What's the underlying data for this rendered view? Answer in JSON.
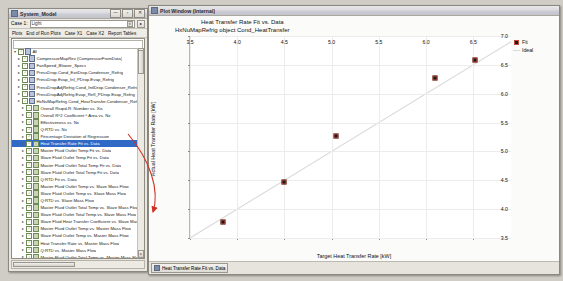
{
  "system_window": {
    "title": "System_Model",
    "icon": "app-icon",
    "buttons": {
      "minimize": "—",
      "maximize": "▫",
      "close": "✕"
    },
    "toolbar": {
      "case_label": "Case 1:",
      "case_value": "Light",
      "dropdown_icon": "▾",
      "button_icon": "▸"
    },
    "menu": [
      "Plots",
      "End of Run Plots",
      "Case X1",
      "Case X2",
      "Report Tables"
    ],
    "search_placeholder": "",
    "tree": [
      {
        "label": "All",
        "depth": 0,
        "checked": true,
        "expanded": true,
        "icon": "folder-icon"
      },
      {
        "label": "CompressorMapRev (CompressorFromData)",
        "depth": 1,
        "checked": true,
        "icon": "file-icon"
      },
      {
        "label": "FanSpeed_Blower_Specs",
        "depth": 1,
        "checked": true,
        "icon": "file-icon"
      },
      {
        "label": "PressDrop.Cond_ExitDrop.Condenser_Refrig",
        "depth": 1,
        "checked": true,
        "icon": "file-icon"
      },
      {
        "label": "PressDrop.Evap_Inl_PDrop.Evap_Refrig",
        "depth": 1,
        "checked": true,
        "icon": "file-icon"
      },
      {
        "label": "PressDropAdjRefrig.Cond_IntlDrop.Condenser_Refrig",
        "depth": 1,
        "checked": true,
        "icon": "file-icon"
      },
      {
        "label": "PressDropAdjRefrig.Evap_Refl_PDrop.Evap_Refrig",
        "depth": 1,
        "checked": true,
        "icon": "file-icon"
      },
      {
        "label": "HxNuMapRefrig.Cond_HeatTransfer.Condenser_Refrig",
        "depth": 1,
        "checked": true,
        "icon": "file-icon"
      },
      {
        "label": "Overall Rsqrd-R: Number vs. Xis",
        "depth": 2,
        "checked": true,
        "icon": "plot-icon"
      },
      {
        "label": "Overall R^2 Coefficient ^ Area vs. Nx",
        "depth": 2,
        "checked": true,
        "icon": "plot-icon"
      },
      {
        "label": "Effectiveness vs. Nx",
        "depth": 2,
        "checked": true,
        "icon": "plot-icon"
      },
      {
        "label": "Q:RTD vs. Nx",
        "depth": 2,
        "checked": true,
        "icon": "plot-icon"
      },
      {
        "label": "Percentage Deviation of Regression",
        "depth": 2,
        "checked": true,
        "icon": "plot-icon"
      },
      {
        "label": "Heat Transfer Rate Fit vs. Data",
        "depth": 2,
        "checked": true,
        "icon": "plot-icon",
        "selected": true
      },
      {
        "label": "Master Fluid Outlet Temp Fit vs. Data",
        "depth": 2,
        "checked": true,
        "icon": "plot-icon"
      },
      {
        "label": "Slave Fluid Outlet Temp Fit vs. Data",
        "depth": 2,
        "checked": true,
        "icon": "plot-icon"
      },
      {
        "label": "Master Fluid Outlet Total Temp Fit vs. Data",
        "depth": 2,
        "checked": true,
        "icon": "plot-icon"
      },
      {
        "label": "Slave Fluid Outlet Total Temp Fit vs. Data",
        "depth": 2,
        "checked": true,
        "icon": "plot-icon"
      },
      {
        "label": "Q:RTD Fit vs. Data",
        "depth": 2,
        "checked": true,
        "icon": "plot-icon"
      },
      {
        "label": "Master Fluid Outlet Temp vs. Slave Mass Flow",
        "depth": 2,
        "checked": true,
        "icon": "plot-icon"
      },
      {
        "label": "Slave Fluid Outlet Temp vs. Slave Mass Flow",
        "depth": 2,
        "checked": true,
        "icon": "plot-icon"
      },
      {
        "label": "Q:RTD vs. Slave Mass Flow",
        "depth": 2,
        "checked": true,
        "icon": "plot-icon"
      },
      {
        "label": "Master Fluid Outlet Total Temp vs. Slave Mass Flow",
        "depth": 2,
        "checked": true,
        "icon": "plot-icon"
      },
      {
        "label": "Slave Fluid Outlet Total Temp vs. Slave Mass Flow",
        "depth": 2,
        "checked": true,
        "icon": "plot-icon"
      },
      {
        "label": "Slave Fluid Heat Transfer Coefficient vs. Slave Mass Flow",
        "depth": 2,
        "checked": true,
        "icon": "plot-icon"
      },
      {
        "label": "Master Fluid Outlet Temp vs. Master Mass Flow",
        "depth": 2,
        "checked": true,
        "icon": "plot-icon"
      },
      {
        "label": "Slave Fluid Outlet Temp vs. Master Mass Flow",
        "depth": 2,
        "checked": true,
        "icon": "plot-icon"
      },
      {
        "label": "Heat Transfer Rate vs. Master Mass Flow",
        "depth": 2,
        "checked": true,
        "icon": "plot-icon"
      },
      {
        "label": "Q:RTD vs. Master Mass Flow",
        "depth": 2,
        "checked": true,
        "icon": "plot-icon"
      },
      {
        "label": "Master Fluid Outlet Total Temp vs. Master Mass Flow",
        "depth": 2,
        "checked": true,
        "icon": "plot-icon"
      },
      {
        "label": "Slave Fluid Outlet Total Temp vs. Master Mass Flow",
        "depth": 2,
        "checked": true,
        "icon": "plot-icon"
      },
      {
        "label": "Heat Transfer Rate vs. Flow Rate",
        "depth": 2,
        "checked": true,
        "icon": "plot-icon"
      }
    ]
  },
  "plot_window": {
    "title": "Plot Window (Internal)",
    "icon": "chart-icon",
    "taskbar_item": "Heat Transfer Rate Fit vs. Data",
    "taskbar_icon": "chart-icon"
  },
  "chart_data": {
    "type": "scatter",
    "title": "Heat Transfer Rate Fit vs. Data",
    "subtitle": "HxNuMapRefrig object Cond_HeatTransfer",
    "xlabel": "Target Heat Transfer Rate [kW]",
    "ylabel": "Actual Heat Transfer Rate [kW]",
    "xlim": [
      3.5,
      6.9
    ],
    "ylim": [
      3.5,
      7.0
    ],
    "xticks": [
      3.5,
      4.0,
      4.5,
      5.0,
      5.5,
      6.0,
      6.5
    ],
    "yticks": [
      3.5,
      4.0,
      4.5,
      5.0,
      5.5,
      6.0,
      6.5,
      7.0
    ],
    "grid": true,
    "legend_position": "right",
    "series": [
      {
        "name": "Fit",
        "type": "scatter",
        "marker": "square",
        "color": "#1a1a1a",
        "edge_color": "#c04a3a",
        "x": [
          3.85,
          4.5,
          5.05,
          6.1,
          6.52
        ],
        "y": [
          3.77,
          4.47,
          5.27,
          6.27,
          6.58
        ]
      },
      {
        "name": "Ideal",
        "type": "line",
        "color": "#d9d9d9",
        "x": [
          3.5,
          6.9
        ],
        "y": [
          3.5,
          6.9
        ]
      }
    ]
  },
  "legend": [
    {
      "label": "Fit",
      "marker": "point-marker"
    },
    {
      "label": "Ideal",
      "marker": "line-marker"
    }
  ],
  "annotation": {
    "arrow": "red-arrow-pointer"
  },
  "colors": {
    "selection": "#3169c6",
    "annotation_arrow": "#d03020",
    "marker_edge": "#c04a3a",
    "ideal_line": "#d9d9d9"
  }
}
